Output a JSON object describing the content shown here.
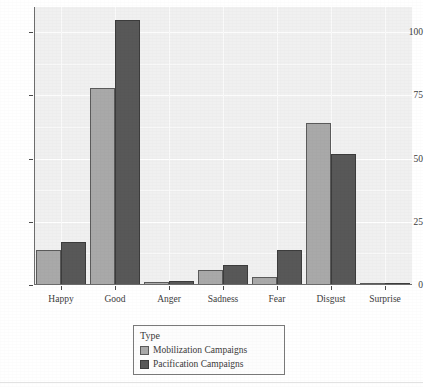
{
  "chart_data": {
    "type": "bar",
    "title": "",
    "subtitle": "",
    "xlabel": "",
    "ylabel": "",
    "categories": [
      "Happy",
      "Good",
      "Anger",
      "Sadness",
      "Fear",
      "Disgust",
      "Surprise"
    ],
    "series": [
      {
        "name": "Mobilization Campaigns",
        "color": "#a9a9a9",
        "values": [
          14,
          78,
          1,
          6,
          3,
          64,
          0.5
        ]
      },
      {
        "name": "Pacification Campaigns",
        "color": "#585858",
        "values": [
          17,
          105,
          1.5,
          8,
          14,
          52,
          0.5
        ]
      }
    ],
    "ylim": [
      0,
      110
    ],
    "yticks": [
      0,
      25,
      50,
      75,
      100
    ],
    "ytick_labels": [
      "0",
      "25",
      "50",
      "75",
      "100"
    ],
    "grid": true,
    "grid_color": "#ffffff",
    "panel_background": "#f0f0f0",
    "legend": {
      "title": "Type",
      "position": "bottom",
      "entries": [
        {
          "label": "Mobilization Campaigns",
          "color": "#a9a9a9",
          "key": "legend-key-light"
        },
        {
          "label": "Pacification Campaigns",
          "color": "#585858",
          "key": "legend-key-dark"
        }
      ]
    }
  }
}
